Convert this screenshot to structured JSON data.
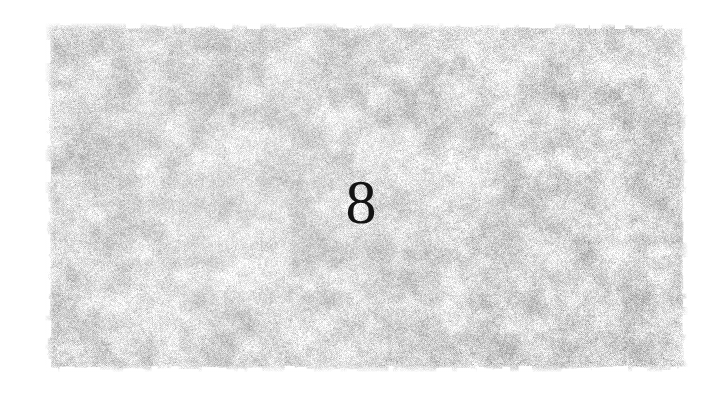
{
  "page": {
    "width": 722,
    "height": 397,
    "background_color": "#ffffff",
    "kind": "scanned-book-page"
  },
  "plate": {
    "label": "scanned-texture-plate",
    "x": 45,
    "y": 23,
    "width": 643,
    "height": 349,
    "description": "mottled grayscale halftone grain block",
    "base_color": "#dcdcdc",
    "highlight_color": "#ffffff",
    "shadow_color": "#9a9a9a",
    "edge_style": "feathered"
  },
  "page_number": {
    "label": "page-number",
    "value": "8",
    "color": "#141414",
    "font_size_px": 62,
    "center_x": 366,
    "center_y": 208
  }
}
